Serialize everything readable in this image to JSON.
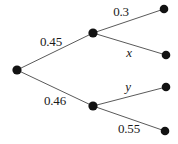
{
  "diagram": {
    "type": "probability-tree",
    "title": "",
    "colors": {
      "node": "#121212",
      "edge": "#5a5a5a",
      "label": "#1a1a1a",
      "background": "#ffffff"
    },
    "nodes": [
      {
        "id": "root",
        "name": "root-node",
        "x": 17,
        "y": 70,
        "r": 4.6
      },
      {
        "id": "n1",
        "name": "upper-branch-node",
        "x": 93,
        "y": 33,
        "r": 4.6
      },
      {
        "id": "n2",
        "name": "lower-branch-node",
        "x": 93,
        "y": 106,
        "r": 4.6
      },
      {
        "id": "l1",
        "name": "leaf-node-1",
        "x": 164,
        "y": 9,
        "r": 4.3
      },
      {
        "id": "l2",
        "name": "leaf-node-2",
        "x": 166,
        "y": 55,
        "r": 4.3
      },
      {
        "id": "l3",
        "name": "leaf-node-3",
        "x": 166,
        "y": 87,
        "r": 4.3
      },
      {
        "id": "l4",
        "name": "leaf-node-4",
        "x": 165,
        "y": 131,
        "r": 4.3
      }
    ],
    "edges": [
      {
        "id": "e1",
        "name": "edge-root-upper",
        "from": "root",
        "to": "n1",
        "x1": 17,
        "y1": 70,
        "x2": 93,
        "y2": 33
      },
      {
        "id": "e2",
        "name": "edge-root-lower",
        "from": "root",
        "to": "n2",
        "x1": 17,
        "y1": 70,
        "x2": 93,
        "y2": 106
      },
      {
        "id": "e3",
        "name": "edge-upper-leaf1",
        "from": "n1",
        "to": "l1",
        "x1": 93,
        "y1": 33,
        "x2": 164,
        "y2": 9
      },
      {
        "id": "e4",
        "name": "edge-upper-leaf2",
        "from": "n1",
        "to": "l2",
        "x1": 93,
        "y1": 33,
        "x2": 166,
        "y2": 55
      },
      {
        "id": "e5",
        "name": "edge-lower-leaf3",
        "from": "n2",
        "to": "l3",
        "x1": 93,
        "y1": 106,
        "x2": 166,
        "y2": 87
      },
      {
        "id": "e6",
        "name": "edge-lower-leaf4",
        "from": "n2",
        "to": "l4",
        "x1": 93,
        "y1": 106,
        "x2": 165,
        "y2": 131
      }
    ],
    "labels": [
      {
        "id": "lab1",
        "name": "edge-label-root-upper",
        "text": "0.45",
        "x": 51,
        "y": 41,
        "italic": false
      },
      {
        "id": "lab2",
        "name": "edge-label-root-lower",
        "text": "0.46",
        "x": 55,
        "y": 100,
        "italic": false
      },
      {
        "id": "lab3",
        "name": "edge-label-upper-leaf1",
        "text": "0.3",
        "x": 121,
        "y": 11,
        "italic": false
      },
      {
        "id": "lab4",
        "name": "edge-label-upper-leaf2",
        "text": "x",
        "x": 129,
        "y": 52,
        "italic": true
      },
      {
        "id": "lab5",
        "name": "edge-label-lower-leaf3",
        "text": "y",
        "x": 128,
        "y": 86,
        "italic": true
      },
      {
        "id": "lab6",
        "name": "edge-label-lower-leaf4",
        "text": "0.55",
        "x": 129,
        "y": 128,
        "italic": false
      }
    ]
  }
}
